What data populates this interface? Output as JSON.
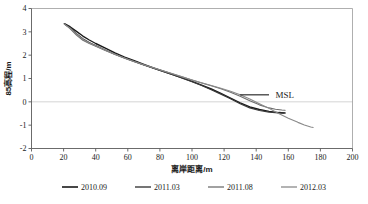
{
  "chart_data": {
    "type": "line",
    "title": "",
    "xlabel": "离岸距离/m",
    "ylabel": "85高程/m",
    "xlim": [
      0,
      200
    ],
    "ylim": [
      -2,
      4
    ],
    "xticks": [
      "0",
      "20",
      "40",
      "60",
      "80",
      "100",
      "120",
      "140",
      "160",
      "180",
      "200"
    ],
    "yticks": [
      "4",
      "3",
      "2",
      "1",
      "0",
      "-1",
      "-2"
    ],
    "grid": "zero-line-only",
    "legend_position": "bottom",
    "annotations": [
      {
        "text": "MSL",
        "x": 152,
        "y": 0.3,
        "leader_from_x": 130,
        "leader_to_x": 148,
        "leader_y": 0.3
      }
    ],
    "series": [
      {
        "name": "2010.09",
        "color": "#1a1a1a",
        "width": 1.4,
        "points": [
          [
            20.5,
            3.35
          ],
          [
            24,
            3.22
          ],
          [
            28,
            3.02
          ],
          [
            32,
            2.82
          ],
          [
            36,
            2.65
          ],
          [
            40,
            2.5
          ],
          [
            46,
            2.3
          ],
          [
            52,
            2.1
          ],
          [
            58,
            1.92
          ],
          [
            64,
            1.76
          ],
          [
            70,
            1.6
          ],
          [
            76,
            1.45
          ],
          [
            82,
            1.31
          ],
          [
            88,
            1.17
          ],
          [
            94,
            1.03
          ],
          [
            100,
            0.88
          ],
          [
            106,
            0.72
          ],
          [
            112,
            0.55
          ],
          [
            118,
            0.36
          ],
          [
            124,
            0.16
          ],
          [
            130,
            -0.04
          ],
          [
            136,
            -0.22
          ],
          [
            142,
            -0.33
          ],
          [
            148,
            -0.41
          ],
          [
            154,
            -0.46
          ],
          [
            158,
            -0.48
          ]
        ]
      },
      {
        "name": "2011.03",
        "color": "#3a3a3a",
        "width": 1.2,
        "points": [
          [
            20.5,
            3.34
          ],
          [
            24,
            3.18
          ],
          [
            28,
            2.92
          ],
          [
            32,
            2.7
          ],
          [
            36,
            2.54
          ],
          [
            40,
            2.41
          ],
          [
            46,
            2.22
          ],
          [
            52,
            2.04
          ],
          [
            58,
            1.88
          ],
          [
            64,
            1.73
          ],
          [
            70,
            1.58
          ],
          [
            76,
            1.44
          ],
          [
            82,
            1.3
          ],
          [
            88,
            1.16
          ],
          [
            94,
            1.01
          ],
          [
            100,
            0.86
          ],
          [
            106,
            0.7
          ],
          [
            112,
            0.52
          ],
          [
            118,
            0.33
          ],
          [
            124,
            0.13
          ],
          [
            130,
            -0.08
          ],
          [
            136,
            -0.26
          ],
          [
            142,
            -0.37
          ],
          [
            148,
            -0.44
          ],
          [
            154,
            -0.47
          ],
          [
            157,
            -0.48
          ]
        ]
      },
      {
        "name": "2011.08",
        "color": "#6e6e6e",
        "width": 1.1,
        "points": [
          [
            20.5,
            3.33
          ],
          [
            24,
            3.14
          ],
          [
            28,
            2.86
          ],
          [
            32,
            2.64
          ],
          [
            36,
            2.5
          ],
          [
            40,
            2.38
          ],
          [
            46,
            2.2
          ],
          [
            52,
            2.03
          ],
          [
            58,
            1.87
          ],
          [
            64,
            1.72
          ],
          [
            70,
            1.58
          ],
          [
            76,
            1.45
          ],
          [
            82,
            1.32
          ],
          [
            88,
            1.19
          ],
          [
            94,
            1.06
          ],
          [
            100,
            0.93
          ],
          [
            106,
            0.81
          ],
          [
            112,
            0.69
          ],
          [
            118,
            0.56
          ],
          [
            124,
            0.41
          ],
          [
            130,
            0.24
          ],
          [
            136,
            0.05
          ],
          [
            142,
            -0.13
          ],
          [
            148,
            -0.26
          ],
          [
            152,
            -0.32
          ],
          [
            156,
            -0.35
          ],
          [
            158,
            -0.36
          ]
        ]
      },
      {
        "name": "2012.03",
        "color": "#8a8a8a",
        "width": 1.1,
        "points": [
          [
            20.5,
            3.33
          ],
          [
            24,
            3.16
          ],
          [
            28,
            2.9
          ],
          [
            32,
            2.68
          ],
          [
            36,
            2.52
          ],
          [
            40,
            2.4
          ],
          [
            46,
            2.21
          ],
          [
            52,
            2.04
          ],
          [
            58,
            1.88
          ],
          [
            64,
            1.73
          ],
          [
            70,
            1.59
          ],
          [
            76,
            1.46
          ],
          [
            82,
            1.33
          ],
          [
            88,
            1.2
          ],
          [
            94,
            1.07
          ],
          [
            100,
            0.94
          ],
          [
            106,
            0.82
          ],
          [
            112,
            0.7
          ],
          [
            118,
            0.58
          ],
          [
            124,
            0.45
          ],
          [
            130,
            0.3
          ],
          [
            136,
            0.12
          ],
          [
            142,
            -0.08
          ],
          [
            148,
            -0.28
          ],
          [
            154,
            -0.5
          ],
          [
            160,
            -0.7
          ],
          [
            166,
            -0.88
          ],
          [
            170,
            -0.99
          ],
          [
            174,
            -1.08
          ],
          [
            175.5,
            -1.1
          ]
        ]
      }
    ]
  },
  "legend": {
    "items": [
      {
        "label": "2010.09"
      },
      {
        "label": "2011.03"
      },
      {
        "label": "2011.08"
      },
      {
        "label": "2012.03"
      }
    ]
  }
}
